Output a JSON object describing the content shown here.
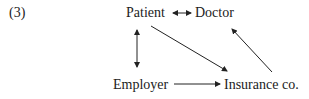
{
  "diagram": {
    "number": "(3)",
    "nodes": {
      "patient": "Patient",
      "doctor": "Doctor",
      "employer": "Employer",
      "insurance": "Insurance co."
    },
    "edges": [
      {
        "from": "patient",
        "to": "doctor",
        "type": "bidirectional"
      },
      {
        "from": "patient",
        "to": "employer",
        "type": "bidirectional"
      },
      {
        "from": "patient",
        "to": "insurance",
        "type": "directed"
      },
      {
        "from": "employer",
        "to": "insurance",
        "type": "directed"
      },
      {
        "from": "insurance",
        "to": "doctor",
        "type": "directed"
      }
    ]
  }
}
